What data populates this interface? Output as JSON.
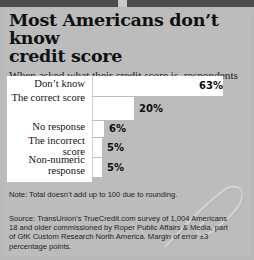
{
  "title": {
    "line1": "Most Americans don’t know",
    "line2": "credit score"
  },
  "subtitle": "When asked what their credit score is, respondents answered with:",
  "chart_data": {
    "type": "bar",
    "orientation": "horizontal",
    "title": "Most Americans don’t know credit score",
    "subtitle": "When asked what their credit score is, respondents answered with:",
    "xlabel": "",
    "ylabel": "",
    "xlim": [
      0,
      63
    ],
    "grid": false,
    "legend": false,
    "categories": [
      "Don’t know",
      "The correct score",
      "No response",
      "The incorrect score",
      "Non-numeric response"
    ],
    "values": [
      63,
      20,
      6,
      5,
      5
    ],
    "value_labels": [
      "63%",
      "20%",
      "6%",
      "5%",
      "5%"
    ],
    "bar_color": "#ffffff",
    "background_color": "#bcbcbc",
    "text_color": "#101010"
  },
  "note": "Note: Total doesn’t add up to 100 due to rounding.",
  "source": "Source: TransUnion’s TrueCredit.com survey of 1,004 Americans 18 and older commissioned by Roper Public Affairs & Media, part of GfK Custom Research North America. Margin of error ±3 percentage points."
}
